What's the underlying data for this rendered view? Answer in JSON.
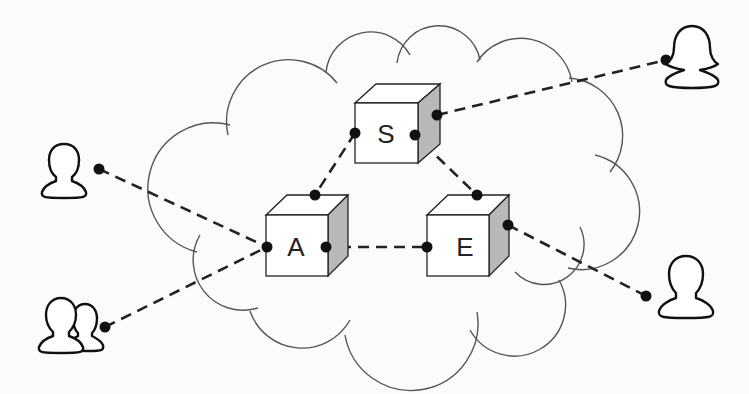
{
  "diagram": {
    "type": "network-topology",
    "cloud": {
      "label": ""
    },
    "nodes": [
      {
        "id": "S",
        "label": "S",
        "kind": "server-cube"
      },
      {
        "id": "A",
        "label": "A",
        "kind": "server-cube"
      },
      {
        "id": "E",
        "label": "E",
        "kind": "server-cube"
      }
    ],
    "users": [
      {
        "id": "user-top-right",
        "kind": "female-user"
      },
      {
        "id": "user-left",
        "kind": "male-user"
      },
      {
        "id": "user-group-bottom-left",
        "kind": "user-group"
      },
      {
        "id": "user-bottom-right",
        "kind": "male-user"
      }
    ],
    "edges": [
      {
        "from": "S",
        "to": "user-top-right",
        "style": "dashed"
      },
      {
        "from": "S",
        "to": "A",
        "style": "dashed"
      },
      {
        "from": "S",
        "to": "E",
        "style": "dashed"
      },
      {
        "from": "A",
        "to": "E",
        "style": "dashed"
      },
      {
        "from": "user-left",
        "to": "A",
        "style": "dashed"
      },
      {
        "from": "user-group-bottom-left",
        "to": "A",
        "style": "dashed"
      },
      {
        "from": "E",
        "to": "user-bottom-right",
        "style": "dashed"
      }
    ],
    "colors": {
      "stroke": "#222222",
      "cloud_stroke": "#555555",
      "cube_face": "#ffffff",
      "cube_side": "#b8b8b8",
      "background": "#fbfbfa"
    }
  }
}
